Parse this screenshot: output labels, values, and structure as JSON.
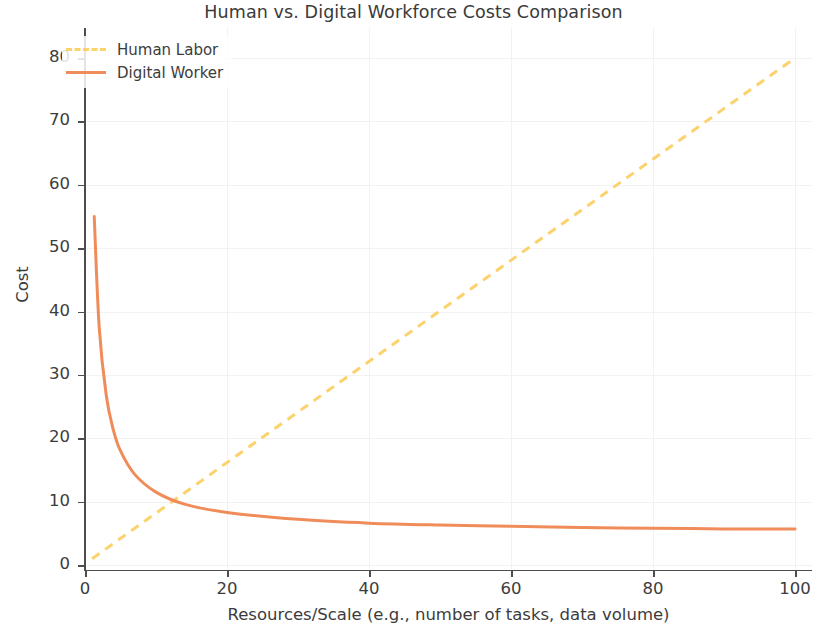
{
  "chart_data": {
    "type": "line",
    "title": "Human vs. Digital Workforce Costs Comparison",
    "xlabel": "Resources/Scale (e.g., number of tasks, data volume)",
    "ylabel": "Cost",
    "xlim": [
      -4,
      104
    ],
    "ylim": [
      -3,
      84
    ],
    "xticks": [
      0,
      20,
      40,
      60,
      80,
      100
    ],
    "yticks": [
      0,
      10,
      20,
      30,
      40,
      50,
      60,
      70,
      80
    ],
    "xtick_labels": [
      "0",
      "20",
      "40",
      "60",
      "80",
      "100"
    ],
    "ytick_labels": [
      "0",
      "10",
      "20",
      "30",
      "40",
      "50",
      "60",
      "70",
      "80"
    ],
    "grid": true,
    "legend_position": "upper left",
    "series": [
      {
        "name": "Human Labor",
        "color": "#FBD26B",
        "style": "dashed",
        "linewidth": 3,
        "description": "Linear growth in cost with scale",
        "x": [
          1,
          10,
          20,
          30,
          40,
          50,
          60,
          70,
          80,
          90,
          100
        ],
        "values": [
          1.0,
          8.9,
          17.8,
          26.7,
          35.6,
          44.5,
          53.4,
          62.3,
          71.2,
          80.1,
          80.0
        ]
      },
      {
        "name": "Digital Worker",
        "color": "#F08C5A",
        "style": "solid",
        "linewidth": 3,
        "description": "Cost decays hyperbolically then flattens",
        "x": [
          1.3,
          2,
          3,
          4,
          5,
          7,
          10,
          14,
          20,
          30,
          40,
          50,
          60,
          70,
          80,
          90,
          100
        ],
        "values": [
          55.0,
          37.5,
          26.7,
          21.3,
          18.0,
          14.3,
          11.5,
          9.6,
          8.3,
          7.2,
          6.6,
          6.3,
          6.1,
          5.9,
          5.8,
          5.7,
          5.7
        ]
      }
    ],
    "annotations": {
      "crossover_x": 14,
      "crossover_y": 11.4
    }
  }
}
